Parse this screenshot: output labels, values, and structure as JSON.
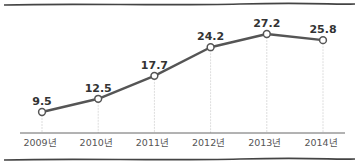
{
  "chart_data": {
    "type": "line",
    "title": "",
    "xlabel": "",
    "ylabel": "",
    "categories": [
      "2009년",
      "2010년",
      "2011년",
      "2012년",
      "2013년",
      "2014년"
    ],
    "values": [
      9.5,
      12.5,
      17.7,
      24.2,
      27.2,
      25.8
    ],
    "value_labels": [
      "9.5",
      "12.5",
      "17.7",
      "24.2",
      "27.2",
      "25.8"
    ],
    "series": [
      {
        "name": "",
        "values": [
          9.5,
          12.5,
          17.7,
          24.2,
          27.2,
          25.8
        ]
      }
    ],
    "ylim": [
      5,
      30
    ],
    "grid": false,
    "drop_lines": true,
    "legend": null,
    "colors": {
      "line": "#555555",
      "marker_fill": "#ffffff",
      "drop_line": "#dddddd",
      "axis": "#666666",
      "border": "#444444"
    }
  }
}
